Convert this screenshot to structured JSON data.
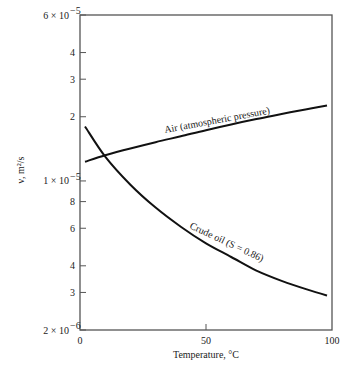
{
  "chart_data": {
    "type": "line",
    "title": "",
    "xlabel": "Temperature, °C",
    "ylabel": "ν, m²/s",
    "xlim": [
      0,
      100
    ],
    "ylim": [
      2e-06,
      6e-05
    ],
    "yscale": "log",
    "grid": false,
    "legend": "inline curve labels",
    "x_ticks": [
      {
        "value": 0,
        "label": "0"
      },
      {
        "value": 50,
        "label": "50"
      },
      {
        "value": 100,
        "label": "100"
      }
    ],
    "y_ticks": [
      {
        "value": 6e-05,
        "label": "6 × 10⁻⁵",
        "mantissa": "6 × 10",
        "exp": "−5"
      },
      {
        "value": 4e-05,
        "label": "4"
      },
      {
        "value": 3e-05,
        "label": "3"
      },
      {
        "value": 2e-05,
        "label": "2"
      },
      {
        "value": 1e-05,
        "label": "1 × 10⁻⁵",
        "mantissa": "1 × 10",
        "exp": "−5"
      },
      {
        "value": 8e-06,
        "label": "8"
      },
      {
        "value": 6e-06,
        "label": "6"
      },
      {
        "value": 4e-06,
        "label": "4"
      },
      {
        "value": 3e-06,
        "label": "3"
      },
      {
        "value": 2e-06,
        "label": "2 × 10⁻⁶",
        "mantissa": "2 × 10",
        "exp": "−6"
      }
    ],
    "series": [
      {
        "name": "Air (atmospheric pressure)",
        "x": [
          2,
          10,
          20,
          30,
          40,
          50,
          60,
          70,
          80,
          90,
          98
        ],
        "y": [
          1.23e-05,
          1.32e-05,
          1.42e-05,
          1.52e-05,
          1.62e-05,
          1.73e-05,
          1.84e-05,
          1.95e-05,
          2.06e-05,
          2.17e-05,
          2.26e-05
        ]
      },
      {
        "name": "Crude oil (S = 0.86)",
        "x": [
          2,
          10,
          20,
          30,
          40,
          50,
          60,
          70,
          80,
          90,
          98
        ],
        "y": [
          1.8e-05,
          1.3e-05,
          9.6e-06,
          7.5e-06,
          6.1e-06,
          5.1e-06,
          4.4e-06,
          3.8e-06,
          3.4e-06,
          3.1e-06,
          2.9e-06
        ]
      }
    ]
  },
  "labels": {
    "xlabel": "Temperature, °C",
    "ylabel": "ν, m²/s",
    "air": "Air (atmospheric pressure)",
    "oil": "Crude oil (S = 0.86)"
  }
}
